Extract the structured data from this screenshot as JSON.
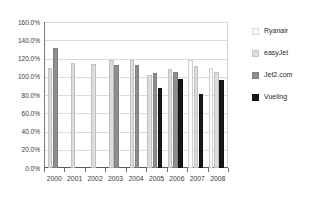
{
  "chart_data": {
    "type": "bar",
    "title": "",
    "subtitle": "",
    "xlabel": "",
    "ylabel": "",
    "categories": [
      "2000",
      "2001",
      "2002",
      "2003",
      "2004",
      "2005",
      "2006",
      "2007",
      "2008"
    ],
    "ylim": [
      0,
      160
    ],
    "yticks": [
      0,
      20,
      40,
      60,
      80,
      100,
      120,
      140,
      160
    ],
    "ytick_labels": [
      "0.0%",
      "20.0%",
      "40.0%",
      "60.0%",
      "80.0%",
      "100.0%",
      "120.0%",
      "140.0%",
      "160.0%"
    ],
    "y_unit": "%",
    "grid": true,
    "legend_position": "right",
    "series": [
      {
        "name": "Ryanair",
        "color": "#fbfbfb",
        "values": [
          null,
          null,
          null,
          null,
          null,
          null,
          null,
          118,
          110
        ]
      },
      {
        "name": "easyJet",
        "color": "#dcdcdc",
        "values": [
          110,
          115,
          114,
          118,
          118,
          102,
          108,
          112,
          105
        ]
      },
      {
        "name": "Jet2.com",
        "color": "#8f8f8f",
        "values": [
          131,
          null,
          null,
          113,
          113,
          104,
          105,
          null,
          null
        ]
      },
      {
        "name": "Vueling",
        "color": "#171717",
        "values": [
          null,
          null,
          null,
          null,
          null,
          88,
          98,
          81,
          96
        ]
      }
    ]
  },
  "legend": {
    "entries": [
      {
        "label": "Ryanair",
        "key": "ryanair"
      },
      {
        "label": "easyJet",
        "key": "easyjet"
      },
      {
        "label": "Jet2.com",
        "key": "jet2"
      },
      {
        "label": "Vueling",
        "key": "vueling"
      }
    ]
  }
}
